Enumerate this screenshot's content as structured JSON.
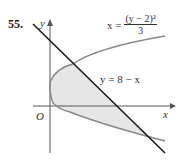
{
  "figure": {
    "problem_number": "55.",
    "axis_labels": {
      "y": "y",
      "x": "x",
      "origin": "O"
    },
    "line_equation": "y = 8 − x",
    "parabola_equation": {
      "lhs": "x = ",
      "numerator": "(y − 2)²",
      "denominator": "3"
    },
    "colors": {
      "line": "#1a1a1a",
      "parabola": "#8a8a8a",
      "shaded_region": "#e6e6e6",
      "axes": "#555555"
    }
  }
}
